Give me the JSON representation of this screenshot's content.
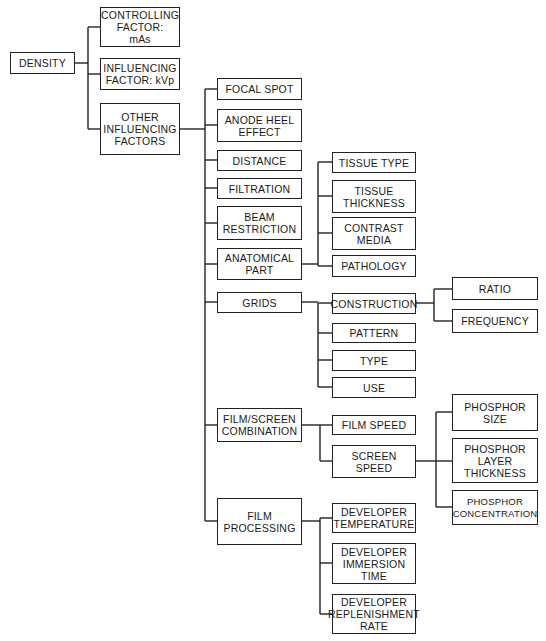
{
  "diagram": {
    "title": "DENSITY",
    "root": {
      "id": "density",
      "label": "DENSITY"
    },
    "level1": [
      {
        "id": "controlling-factor",
        "label": "CONTROLLING\nFACTOR:\nmAs"
      },
      {
        "id": "influencing-factor",
        "label": "INFLUENCING\nFACTOR:  kVp"
      },
      {
        "id": "other-influencing-factors",
        "label": "OTHER\nINFLUENCING\nFACTORS"
      }
    ],
    "level2": [
      {
        "id": "focal-spot",
        "label": "FOCAL  SPOT"
      },
      {
        "id": "anode-heel-effect",
        "label": "ANODE  HEEL\nEFFECT"
      },
      {
        "id": "distance",
        "label": "DISTANCE"
      },
      {
        "id": "filtration",
        "label": "FILTRATION"
      },
      {
        "id": "beam-restriction",
        "label": "BEAM\nRESTRICTION"
      },
      {
        "id": "anatomical-part",
        "label": "ANATOMICAL\nPART"
      },
      {
        "id": "grids",
        "label": "GRIDS"
      },
      {
        "id": "film-screen-combination",
        "label": "FILM/SCREEN\nCOMBINATION"
      },
      {
        "id": "film-processing",
        "label": "FILM\nPROCESSING"
      }
    ],
    "level3": [
      {
        "id": "tissue-type",
        "label": "TISSUE  TYPE",
        "parent": "anatomical-part"
      },
      {
        "id": "tissue-thickness",
        "label": "TISSUE\nTHICKNESS",
        "parent": "anatomical-part"
      },
      {
        "id": "contrast-media",
        "label": "CONTRAST\nMEDIA",
        "parent": "anatomical-part"
      },
      {
        "id": "pathology",
        "label": "PATHOLOGY",
        "parent": "anatomical-part"
      },
      {
        "id": "construction",
        "label": "CONSTRUCTION",
        "parent": "grids"
      },
      {
        "id": "pattern",
        "label": "PATTERN",
        "parent": "grids"
      },
      {
        "id": "type",
        "label": "TYPE",
        "parent": "grids"
      },
      {
        "id": "use",
        "label": "USE",
        "parent": "grids"
      },
      {
        "id": "film-speed",
        "label": "FILM  SPEED",
        "parent": "film-screen-combination"
      },
      {
        "id": "screen-speed",
        "label": "SCREEN\nSPEED",
        "parent": "film-screen-combination"
      },
      {
        "id": "developer-temperature",
        "label": "DEVELOPER\nTEMPERATURE",
        "parent": "film-processing"
      },
      {
        "id": "developer-immersion-time",
        "label": "DEVELOPER\nIMMERSION\nTIME",
        "parent": "film-processing"
      },
      {
        "id": "developer-replenishment-rate",
        "label": "DEVELOPER\nREPLENISHMENT\nRATE",
        "parent": "film-processing"
      }
    ],
    "level4": [
      {
        "id": "ratio",
        "label": "RATIO",
        "parent": "construction"
      },
      {
        "id": "frequency",
        "label": "FREQUENCY",
        "parent": "construction"
      },
      {
        "id": "phosphor-size",
        "label": "PHOSPHOR\nSIZE",
        "parent": "screen-speed"
      },
      {
        "id": "phosphor-layer-thickness",
        "label": "PHOSPHOR\nLAYER\nTHICKNESS",
        "parent": "screen-speed"
      },
      {
        "id": "phosphor-concentration",
        "label": "PHOSPHOR\nCONCENTRATION",
        "parent": "screen-speed"
      }
    ]
  }
}
